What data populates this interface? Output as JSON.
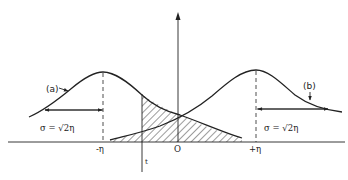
{
  "diagram": {
    "type": "two overlapping gaussian distributions with shaded tail overlap",
    "curves": [
      {
        "id": "a",
        "label": "(a)",
        "mean_label": "-η",
        "sigma_label": "σ = √2η"
      },
      {
        "id": "b",
        "label": "(b)",
        "mean_label": "+η",
        "sigma_label": "σ = √2η"
      }
    ],
    "axis": {
      "origin_label": "O",
      "threshold_label": "t"
    },
    "colors": {
      "ink": "#222222",
      "background": "#ffffff"
    }
  }
}
